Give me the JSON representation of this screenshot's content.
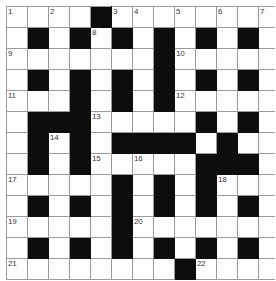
{
  "puzzle": {
    "title": "Crossword Grid",
    "columns": 13,
    "rows": 13,
    "cell_size_px": 20,
    "colors": {
      "block": "#0d0d0d",
      "open": "#fdfdfd",
      "grid_line": "#9a9a9a",
      "number_text": "#3a3a3a"
    },
    "clue_numbers_visible": [
      1,
      2,
      3,
      4,
      5,
      6,
      7,
      8,
      9,
      10,
      11,
      12,
      13,
      14,
      15,
      16,
      17,
      18,
      19,
      20,
      21,
      22
    ],
    "max_clue_number": 22,
    "grid": [
      [
        {
          "type": "open",
          "number": "1"
        },
        {
          "type": "open",
          "number": ""
        },
        {
          "type": "open",
          "number": "2"
        },
        {
          "type": "open",
          "number": ""
        },
        {
          "type": "block",
          "number": ""
        },
        {
          "type": "open",
          "number": "3"
        },
        {
          "type": "open",
          "number": "4"
        },
        {
          "type": "open",
          "number": ""
        },
        {
          "type": "open",
          "number": "5"
        },
        {
          "type": "open",
          "number": ""
        },
        {
          "type": "open",
          "number": "6"
        },
        {
          "type": "open",
          "number": ""
        },
        {
          "type": "open",
          "number": "7"
        }
      ],
      [
        {
          "type": "open",
          "number": ""
        },
        {
          "type": "block",
          "number": ""
        },
        {
          "type": "open",
          "number": ""
        },
        {
          "type": "block",
          "number": ""
        },
        {
          "type": "open",
          "number": "8"
        },
        {
          "type": "block",
          "number": ""
        },
        {
          "type": "open",
          "number": ""
        },
        {
          "type": "block",
          "number": ""
        },
        {
          "type": "open",
          "number": ""
        },
        {
          "type": "block",
          "number": ""
        },
        {
          "type": "open",
          "number": ""
        },
        {
          "type": "block",
          "number": ""
        },
        {
          "type": "open",
          "number": ""
        }
      ],
      [
        {
          "type": "open",
          "number": "9"
        },
        {
          "type": "open",
          "number": ""
        },
        {
          "type": "open",
          "number": ""
        },
        {
          "type": "open",
          "number": ""
        },
        {
          "type": "open",
          "number": ""
        },
        {
          "type": "open",
          "number": ""
        },
        {
          "type": "open",
          "number": ""
        },
        {
          "type": "block",
          "number": ""
        },
        {
          "type": "open",
          "number": "10"
        },
        {
          "type": "open",
          "number": ""
        },
        {
          "type": "open",
          "number": ""
        },
        {
          "type": "open",
          "number": ""
        },
        {
          "type": "open",
          "number": ""
        }
      ],
      [
        {
          "type": "open",
          "number": ""
        },
        {
          "type": "block",
          "number": ""
        },
        {
          "type": "open",
          "number": ""
        },
        {
          "type": "block",
          "number": ""
        },
        {
          "type": "open",
          "number": ""
        },
        {
          "type": "block",
          "number": ""
        },
        {
          "type": "open",
          "number": ""
        },
        {
          "type": "block",
          "number": ""
        },
        {
          "type": "open",
          "number": ""
        },
        {
          "type": "block",
          "number": ""
        },
        {
          "type": "open",
          "number": ""
        },
        {
          "type": "block",
          "number": ""
        },
        {
          "type": "open",
          "number": ""
        }
      ],
      [
        {
          "type": "open",
          "number": "11"
        },
        {
          "type": "open",
          "number": ""
        },
        {
          "type": "open",
          "number": ""
        },
        {
          "type": "block",
          "number": ""
        },
        {
          "type": "open",
          "number": ""
        },
        {
          "type": "block",
          "number": ""
        },
        {
          "type": "open",
          "number": ""
        },
        {
          "type": "block",
          "number": ""
        },
        {
          "type": "open",
          "number": "12"
        },
        {
          "type": "open",
          "number": ""
        },
        {
          "type": "open",
          "number": ""
        },
        {
          "type": "open",
          "number": ""
        },
        {
          "type": "open",
          "number": ""
        }
      ],
      [
        {
          "type": "open",
          "number": ""
        },
        {
          "type": "block",
          "number": ""
        },
        {
          "type": "block",
          "number": ""
        },
        {
          "type": "block",
          "number": ""
        },
        {
          "type": "open",
          "number": "13"
        },
        {
          "type": "open",
          "number": ""
        },
        {
          "type": "open",
          "number": ""
        },
        {
          "type": "open",
          "number": ""
        },
        {
          "type": "open",
          "number": ""
        },
        {
          "type": "block",
          "number": ""
        },
        {
          "type": "open",
          "number": ""
        },
        {
          "type": "block",
          "number": ""
        },
        {
          "type": "open",
          "number": ""
        }
      ],
      [
        {
          "type": "open",
          "number": ""
        },
        {
          "type": "block",
          "number": ""
        },
        {
          "type": "open",
          "number": "14"
        },
        {
          "type": "block",
          "number": ""
        },
        {
          "type": "open",
          "number": ""
        },
        {
          "type": "block",
          "number": ""
        },
        {
          "type": "block",
          "number": ""
        },
        {
          "type": "block",
          "number": ""
        },
        {
          "type": "block",
          "number": ""
        },
        {
          "type": "open",
          "number": ""
        },
        {
          "type": "block",
          "number": ""
        },
        {
          "type": "open",
          "number": ""
        },
        {
          "type": "open",
          "number": ""
        }
      ],
      [
        {
          "type": "open",
          "number": ""
        },
        {
          "type": "block",
          "number": ""
        },
        {
          "type": "open",
          "number": ""
        },
        {
          "type": "block",
          "number": ""
        },
        {
          "type": "open",
          "number": "15"
        },
        {
          "type": "open",
          "number": ""
        },
        {
          "type": "open",
          "number": "16"
        },
        {
          "type": "open",
          "number": ""
        },
        {
          "type": "open",
          "number": ""
        },
        {
          "type": "block",
          "number": ""
        },
        {
          "type": "block",
          "number": ""
        },
        {
          "type": "block",
          "number": ""
        },
        {
          "type": "open",
          "number": ""
        }
      ],
      [
        {
          "type": "open",
          "number": "17"
        },
        {
          "type": "open",
          "number": ""
        },
        {
          "type": "open",
          "number": ""
        },
        {
          "type": "open",
          "number": ""
        },
        {
          "type": "open",
          "number": ""
        },
        {
          "type": "block",
          "number": ""
        },
        {
          "type": "open",
          "number": ""
        },
        {
          "type": "block",
          "number": ""
        },
        {
          "type": "open",
          "number": ""
        },
        {
          "type": "block",
          "number": ""
        },
        {
          "type": "open",
          "number": "18"
        },
        {
          "type": "open",
          "number": ""
        },
        {
          "type": "open",
          "number": ""
        }
      ],
      [
        {
          "type": "open",
          "number": ""
        },
        {
          "type": "block",
          "number": ""
        },
        {
          "type": "open",
          "number": ""
        },
        {
          "type": "block",
          "number": ""
        },
        {
          "type": "open",
          "number": ""
        },
        {
          "type": "block",
          "number": ""
        },
        {
          "type": "open",
          "number": ""
        },
        {
          "type": "block",
          "number": ""
        },
        {
          "type": "open",
          "number": ""
        },
        {
          "type": "block",
          "number": ""
        },
        {
          "type": "open",
          "number": ""
        },
        {
          "type": "block",
          "number": ""
        },
        {
          "type": "open",
          "number": ""
        }
      ],
      [
        {
          "type": "open",
          "number": "19"
        },
        {
          "type": "open",
          "number": ""
        },
        {
          "type": "open",
          "number": ""
        },
        {
          "type": "open",
          "number": ""
        },
        {
          "type": "open",
          "number": ""
        },
        {
          "type": "block",
          "number": ""
        },
        {
          "type": "open",
          "number": "20"
        },
        {
          "type": "open",
          "number": ""
        },
        {
          "type": "open",
          "number": ""
        },
        {
          "type": "open",
          "number": ""
        },
        {
          "type": "open",
          "number": ""
        },
        {
          "type": "open",
          "number": ""
        },
        {
          "type": "open",
          "number": ""
        }
      ],
      [
        {
          "type": "open",
          "number": ""
        },
        {
          "type": "block",
          "number": ""
        },
        {
          "type": "open",
          "number": ""
        },
        {
          "type": "block",
          "number": ""
        },
        {
          "type": "open",
          "number": ""
        },
        {
          "type": "block",
          "number": ""
        },
        {
          "type": "open",
          "number": ""
        },
        {
          "type": "block",
          "number": ""
        },
        {
          "type": "open",
          "number": ""
        },
        {
          "type": "block",
          "number": ""
        },
        {
          "type": "open",
          "number": ""
        },
        {
          "type": "block",
          "number": ""
        },
        {
          "type": "open",
          "number": ""
        }
      ],
      [
        {
          "type": "open",
          "number": "21"
        },
        {
          "type": "open",
          "number": ""
        },
        {
          "type": "open",
          "number": ""
        },
        {
          "type": "open",
          "number": ""
        },
        {
          "type": "open",
          "number": ""
        },
        {
          "type": "open",
          "number": ""
        },
        {
          "type": "open",
          "number": ""
        },
        {
          "type": "open",
          "number": ""
        },
        {
          "type": "block",
          "number": ""
        },
        {
          "type": "open",
          "number": "22"
        },
        {
          "type": "open",
          "number": ""
        },
        {
          "type": "open",
          "number": ""
        },
        {
          "type": "open",
          "number": ""
        }
      ]
    ]
  }
}
